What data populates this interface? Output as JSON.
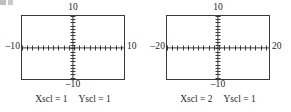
{
  "figure": {
    "type": "graphing-calculator-viewing-windows",
    "count": 2
  },
  "graphs": [
    {
      "id": "left",
      "labels": {
        "top": "10",
        "bottom": "–10",
        "left": "–10",
        "right": "10"
      },
      "caption": {
        "xscl": "Xscl = 1",
        "yscl": "Yscl = 1"
      },
      "window": {
        "xmin": -10,
        "xmax": 10,
        "ymin": -10,
        "ymax": 10,
        "xscl": 1,
        "yscl": 1
      },
      "ticks": {
        "x_count": 20,
        "y_count": 20
      }
    },
    {
      "id": "right",
      "labels": {
        "top": "10",
        "bottom": "–10",
        "left": "–20",
        "right": "20"
      },
      "caption": {
        "xscl": "Xscl = 2",
        "yscl": "Yscl = 1"
      },
      "window": {
        "xmin": -20,
        "xmax": 20,
        "ymin": -10,
        "ymax": 10,
        "xscl": 2,
        "yscl": 1
      },
      "ticks": {
        "x_count": 20,
        "y_count": 20
      }
    }
  ],
  "colors": {
    "ink": "#231f20",
    "line": "#3b3a3a",
    "background": "#ffffff"
  }
}
